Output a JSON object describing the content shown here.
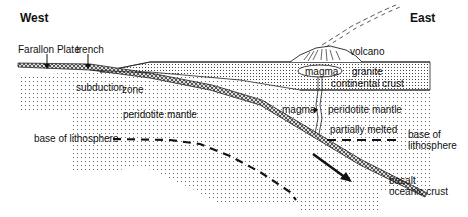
{
  "diagram": {
    "type": "cross-section",
    "headings": {
      "west": "West",
      "east": "East"
    },
    "labels": {
      "farallon_plate": "Farallon Plate",
      "trench": "trench",
      "volcano": "volcano",
      "magma_chamber": "magma",
      "granite": "granite",
      "continental_crust": "continental crust",
      "subduction": "subduction",
      "zone": "zone",
      "peridotite_mantle_left": "peridotite mantle",
      "magma_arrow": "magma",
      "peridotite_mantle_right": "peridotite mantle",
      "partially_melted": "partially melted",
      "base_of_lithosphere_left": "base of lithosphere",
      "base_of_lithosphere_right_1": "base of",
      "base_of_lithosphere_right_2": "lithosphere",
      "basalt": "basalt",
      "oceanic_crust": "oceanic crust"
    },
    "colors": {
      "ink": "#111111",
      "background": "#ffffff",
      "dots": "#555555"
    }
  }
}
